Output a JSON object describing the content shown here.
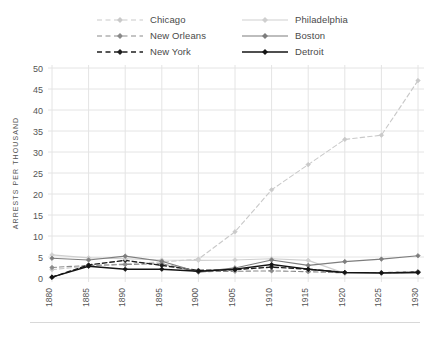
{
  "chart_data": {
    "type": "line",
    "title": "",
    "subtitle": "",
    "xlabel": "YEAR",
    "ylabel": "ARRESTS PER THOUSAND",
    "x": [
      1880,
      1885,
      1890,
      1895,
      1900,
      1905,
      1910,
      1915,
      1920,
      1925,
      1930
    ],
    "xtick_labels": [
      "1880",
      "1885",
      "1890",
      "1895",
      "1900",
      "1905",
      "1910",
      "1915",
      "1920",
      "1925",
      "1930"
    ],
    "ytick_labels": [
      "0",
      "5",
      "10",
      "15",
      "20",
      "25",
      "30",
      "35",
      "40",
      "45",
      "50"
    ],
    "ytick_values": [
      0,
      5,
      10,
      15,
      20,
      25,
      30,
      35,
      40,
      45,
      50
    ],
    "ylim": [
      0,
      50
    ],
    "xlim": [
      1880,
      1930
    ],
    "grid": true,
    "legend_position": "top",
    "series": [
      {
        "name": "Chicago",
        "color": "#c9c9c9",
        "style": "dashed",
        "marker": "diamond",
        "values": [
          2.0,
          2.8,
          3.4,
          3.8,
          4.5,
          11.0,
          21.0,
          27.0,
          33.0,
          34.0,
          47.0
        ]
      },
      {
        "name": "New Orleans",
        "color": "#8a8a8a",
        "style": "dashed",
        "marker": "diamond",
        "values": [
          2.5,
          3.0,
          3.2,
          3.4,
          1.5,
          1.6,
          1.7,
          1.5,
          1.2,
          1.3,
          1.5
        ]
      },
      {
        "name": "New York",
        "color": "#1f1f1f",
        "style": "dashed",
        "marker": "diamond",
        "values": [
          0.2,
          3.1,
          4.2,
          3.0,
          1.8,
          2.0,
          2.6,
          2.1,
          1.3,
          1.2,
          1.4
        ]
      },
      {
        "name": "Philadelphia",
        "color": "#cfcfcf",
        "style": "solid",
        "marker": "diamond",
        "values": [
          5.5,
          4.8,
          4.6,
          4.3,
          4.2,
          4.3,
          4.6,
          4.2,
          1.1,
          1.1,
          1.2
        ]
      },
      {
        "name": "Boston",
        "color": "#7d7d7d",
        "style": "solid",
        "marker": "diamond",
        "values": [
          4.7,
          4.3,
          5.2,
          4.0,
          1.4,
          2.4,
          4.3,
          3.0,
          3.9,
          4.5,
          5.3
        ]
      },
      {
        "name": "Detroit",
        "color": "#141414",
        "style": "solid",
        "marker": "diamond",
        "values": [
          0.2,
          2.8,
          2.1,
          2.1,
          1.6,
          2.1,
          3.2,
          2.1,
          1.3,
          1.2,
          1.3
        ]
      }
    ]
  },
  "legend": {
    "items": [
      {
        "label": "Chicago",
        "series_index": 0
      },
      {
        "label": "Philadelphia",
        "series_index": 3
      },
      {
        "label": "New Orleans",
        "series_index": 1
      },
      {
        "label": "Boston",
        "series_index": 4
      },
      {
        "label": "New York",
        "series_index": 2
      },
      {
        "label": "Detroit",
        "series_index": 5
      }
    ]
  },
  "axes": {
    "grid_color": "#e4e4e4",
    "text_color": "#555555"
  }
}
